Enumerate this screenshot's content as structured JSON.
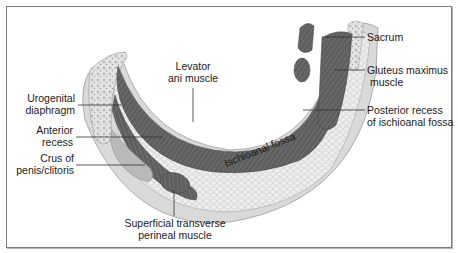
{
  "diagram": {
    "type": "anatomical cross-section",
    "colors": {
      "border": "#7a7a7a",
      "skin": "#d9d9d9",
      "fat": "#ececec",
      "muscle": "#5e5e5e",
      "bone": "#e6e6e6",
      "crus": "#b9b9b9",
      "label_text": "#1a1a1a",
      "leader_line": "#333333"
    },
    "labels": {
      "levator": {
        "line1": "Levator",
        "line2": "ani muscle"
      },
      "urogenital": {
        "line1": "Urogenital",
        "line2": "diaphragm"
      },
      "anterior": {
        "line1": "Anterior",
        "line2": "recess"
      },
      "crus": {
        "line1": "Crus of",
        "line2": "penis/clitoris"
      },
      "superficial": {
        "line1": "Superficial transverse",
        "line2": "perineal muscle"
      },
      "sacrum": {
        "line1": "Sacrum"
      },
      "gluteus": {
        "line1": "Gluteus maximus",
        "line2": "muscle"
      },
      "posterior": {
        "line1": "Posterior recess",
        "line2": "of ischioanal fossa"
      },
      "fossa": {
        "line1": "Ischioanal fossa"
      }
    }
  }
}
